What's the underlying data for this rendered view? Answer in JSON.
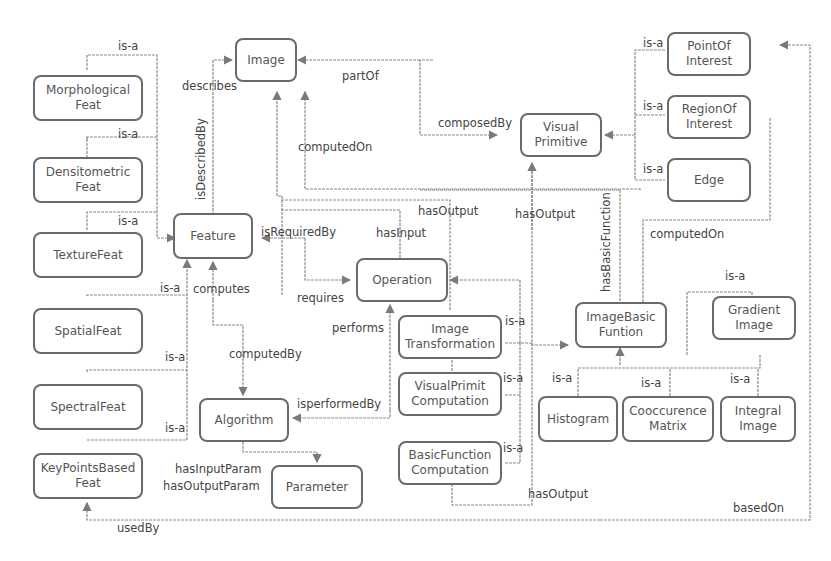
{
  "nodes": {
    "image": "Image",
    "morphological": "Morphological\nFeat",
    "densitometric": "Densitometric\nFeat",
    "texture": "TextureFeat",
    "spatial": "SpatialFeat",
    "spectral": "SpectralFeat",
    "keypoints": "KeyPointsBased\nFeat",
    "feature": "Feature",
    "operation": "Operation",
    "algorithm": "Algorithm",
    "parameter": "Parameter",
    "visual_primitive": "Visual\nPrimitive",
    "point_of_interest": "PointOf\nInterest",
    "region_of_interest": "RegionOf\nInterest",
    "edge": "Edge",
    "image_transformation": "Image\nTransformation",
    "visual_primit_computation": "VisualPrimit\nComputation",
    "basic_function_computation": "BasicFunction\nComputation",
    "image_basic_funtion": "ImageBasic\nFuntion",
    "gradient_image": "Gradient\nImage",
    "histogram": "Histogram",
    "cooccurence_matrix": "Cooccurence\nMatrix",
    "integral_image": "Integral\nImage"
  },
  "edges": {
    "is_a": "is-a",
    "describes": "describes",
    "is_described_by": "isDescribedBy",
    "part_of": "partOf",
    "composed_by": "composedBy",
    "computed_on": "computedOn",
    "computed_on_2": "computedOn",
    "has_output": "hasOutput",
    "has_output_2": "hasOutput",
    "has_output_3": "hasOutput",
    "has_input": "hasInput",
    "is_required_by": "isRequiredBy",
    "requires": "requires",
    "computes": "computes",
    "computed_by": "computedBy",
    "performs": "performs",
    "is_performed_by": "isperformedBy",
    "has_input_param": "hasInputParam",
    "has_output_param": "hasOutputParam",
    "used_by": "usedBy",
    "has_basic_function": "hasBasicFunction",
    "based_on": "basedOn"
  },
  "colors": {
    "node_border": "#6a6a6a",
    "line": "#8a8a8a",
    "text": "#555555"
  }
}
